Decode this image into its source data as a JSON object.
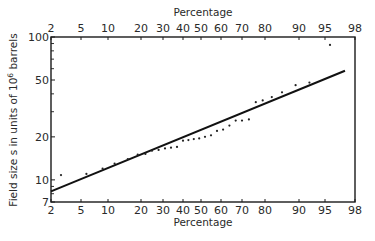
{
  "chart_data": {
    "type": "scatter",
    "title": "",
    "xlabel": "Percentage",
    "x_top_label": "Percentage",
    "ylabel": "Field size s in units of 10^6 barrels",
    "ylabel_parts": {
      "main": "Field size s in units of 10",
      "sup": "6",
      "tail": " barrels"
    },
    "x_scale": "probability (normal)",
    "y_scale": "log",
    "xlim": [
      2,
      98
    ],
    "ylim": [
      7,
      100
    ],
    "x_ticks": [
      2,
      5,
      10,
      20,
      30,
      40,
      50,
      60,
      70,
      80,
      90,
      95,
      98
    ],
    "y_ticks": [
      7,
      10,
      20,
      50,
      100
    ],
    "y_minor_ticks": [
      8,
      9,
      30,
      40,
      60,
      70,
      80,
      90
    ],
    "x_tick_px": [
      51,
      81,
      108,
      141,
      163,
      183,
      201,
      221,
      242,
      265,
      299,
      325,
      355
    ],
    "grid": false,
    "legend": null,
    "fit_line": {
      "name": "Lognormal fit",
      "points": [
        {
          "x": 2,
          "y": 8.3
        },
        {
          "x": 97,
          "y": 58
        }
      ]
    },
    "series": [
      {
        "name": "Observed field sizes",
        "marker": "dot",
        "points": [
          {
            "x": 3,
            "y": 10.8
          },
          {
            "x": 6,
            "y": 11.0
          },
          {
            "x": 9,
            "y": 12.0
          },
          {
            "x": 12,
            "y": 13.0
          },
          {
            "x": 16,
            "y": 14.0
          },
          {
            "x": 19,
            "y": 15.0
          },
          {
            "x": 22,
            "y": 15.2
          },
          {
            "x": 25,
            "y": 16.0
          },
          {
            "x": 28,
            "y": 16.2
          },
          {
            "x": 31,
            "y": 16.6
          },
          {
            "x": 34,
            "y": 16.8
          },
          {
            "x": 37,
            "y": 17.0
          },
          {
            "x": 40,
            "y": 18.8
          },
          {
            "x": 43,
            "y": 19.0
          },
          {
            "x": 46,
            "y": 19.3
          },
          {
            "x": 49,
            "y": 19.5
          },
          {
            "x": 52,
            "y": 20.0
          },
          {
            "x": 55,
            "y": 20.5
          },
          {
            "x": 58,
            "y": 22.0
          },
          {
            "x": 61,
            "y": 22.5
          },
          {
            "x": 64,
            "y": 24.0
          },
          {
            "x": 67,
            "y": 26.0
          },
          {
            "x": 70,
            "y": 26.0
          },
          {
            "x": 73,
            "y": 26.5
          },
          {
            "x": 76,
            "y": 35.0
          },
          {
            "x": 79,
            "y": 36.0
          },
          {
            "x": 82,
            "y": 38.0
          },
          {
            "x": 85,
            "y": 41.0
          },
          {
            "x": 89,
            "y": 46.0
          },
          {
            "x": 92,
            "y": 48.0
          },
          {
            "x": 95.5,
            "y": 88.0
          }
        ]
      }
    ]
  }
}
